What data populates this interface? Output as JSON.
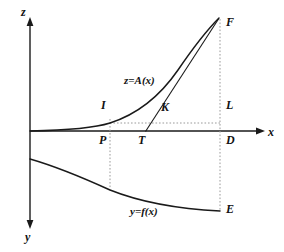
{
  "figure": {
    "title": "",
    "type": "mathematical-diagram",
    "background_color": "#ffffff",
    "stroke_color": "#1a1a1a",
    "dotted_color": "#9a9a9a"
  },
  "axes": {
    "vertical_up_label": "z",
    "vertical_down_label": "y",
    "horizontal_label": "x",
    "origin": {
      "x": 30,
      "y": 131
    }
  },
  "curves": {
    "upper": {
      "label": "z=A(x)",
      "description": "convex increasing curve from origin to F"
    },
    "lower": {
      "label": "y=f(x)",
      "description": "decreasing concave curve from y-axis to E"
    },
    "tangent": {
      "label": "",
      "description": "tangent line from T on x-axis touching upper curve near F"
    }
  },
  "points": [
    {
      "id": "F",
      "label": "F",
      "x": 226,
      "y": 16
    },
    {
      "id": "I",
      "label": "I",
      "x": 101,
      "y": 99
    },
    {
      "id": "K",
      "label": "K",
      "x": 161,
      "y": 101
    },
    {
      "id": "L",
      "label": "L",
      "x": 226,
      "y": 99
    },
    {
      "id": "P",
      "label": "P",
      "x": 99,
      "y": 134
    },
    {
      "id": "T",
      "label": "T",
      "x": 138,
      "y": 134
    },
    {
      "id": "D",
      "label": "D",
      "x": 226,
      "y": 134
    },
    {
      "id": "E",
      "label": "E",
      "x": 226,
      "y": 203
    }
  ],
  "annotations": [
    {
      "id": "upper-curve-label",
      "label": "z=A(x)",
      "x": 124,
      "y": 75
    },
    {
      "id": "lower-curve-label",
      "label": "y=f(x)",
      "x": 130,
      "y": 206
    }
  ],
  "axis_labels": [
    {
      "id": "z-axis-label",
      "label": "z",
      "x": 21,
      "y": 6
    },
    {
      "id": "x-axis-label",
      "label": "x",
      "x": 268,
      "y": 126
    },
    {
      "id": "y-axis-label",
      "label": "y",
      "x": 25,
      "y": 231
    }
  ]
}
